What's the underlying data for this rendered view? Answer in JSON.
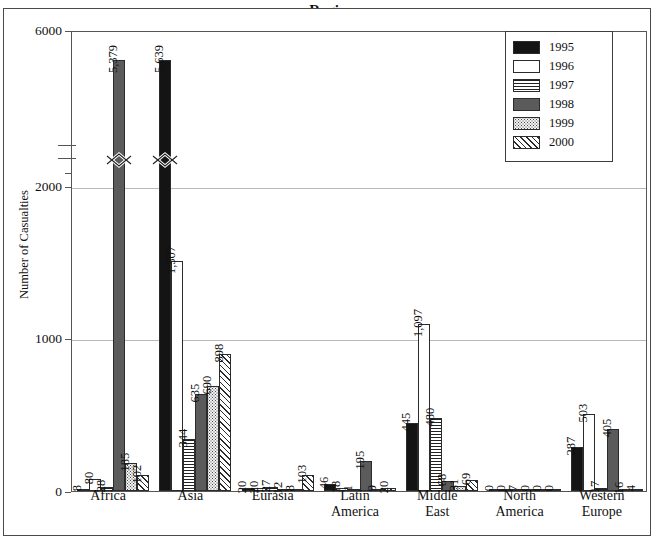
{
  "figure": {
    "title_partial": "y Region,",
    "y_axis_label": "Number of Casualties"
  },
  "legend": {
    "items": [
      {
        "label": "1995",
        "pattern": "solid-black",
        "color": "#141414"
      },
      {
        "label": "1996",
        "pattern": "solid-white",
        "color": "#ffffff"
      },
      {
        "label": "1997",
        "pattern": "horizontal-lines",
        "color": "#ffffff"
      },
      {
        "label": "1998",
        "pattern": "solid-gray",
        "color": "#5b5b5b"
      },
      {
        "label": "1999",
        "pattern": "stipple-dots",
        "color": "#f2f2f2"
      },
      {
        "label": "2000",
        "pattern": "diagonal-hatch",
        "color": "#ffffff"
      }
    ]
  },
  "chart_data": {
    "type": "bar",
    "title": "y Region,",
    "xlabel": "",
    "ylabel": "Number of Casualties",
    "ylim": [
      0,
      6000
    ],
    "yticks": [
      0,
      1000,
      2000,
      6000
    ],
    "ytick_labels": [
      "0",
      "1000",
      "2000",
      "6000"
    ],
    "axis_break": {
      "present": true,
      "between": [
        2000,
        6000
      ],
      "note": "y axis broken above 2000"
    },
    "grid": "horizontal",
    "legend_position": "top-right",
    "categories": [
      "Africa",
      "Asia",
      "Eurasia",
      "Latin\nAmerica",
      "Middle\nEast",
      "North\nAmerica",
      "Western\nEurope"
    ],
    "series": [
      {
        "name": "1995",
        "values": [
          8,
          5639,
          20,
          46,
          445,
          0,
          287
        ],
        "labels": [
          "8",
          "5,639",
          "20",
          "46",
          "445",
          "0",
          "287"
        ]
      },
      {
        "name": "1996",
        "values": [
          80,
          1507,
          20,
          18,
          1097,
          0,
          503
        ],
        "labels": [
          "80",
          "1,507",
          "20",
          "18",
          "1,097",
          "0",
          "503"
        ]
      },
      {
        "name": "1997",
        "values": [
          28,
          344,
          27,
          1,
          480,
          7,
          17
        ],
        "labels": [
          "28",
          "344",
          "27",
          "1",
          "480",
          "7",
          "17"
        ]
      },
      {
        "name": "1998",
        "values": [
          5379,
          635,
          12,
          195,
          68,
          0,
          405
        ],
        "labels": [
          "5,379",
          "635",
          "12",
          "195",
          "68",
          "0",
          "405"
        ]
      },
      {
        "name": "1999",
        "values": [
          185,
          690,
          8,
          9,
          31,
          0,
          16
        ],
        "labels": [
          "185",
          "690",
          "8",
          "9",
          "31",
          "0",
          "16"
        ]
      },
      {
        "name": "2000",
        "values": [
          102,
          898,
          103,
          20,
          69,
          0,
          4
        ],
        "labels": [
          "102",
          "898",
          "103",
          "20",
          "69",
          "0",
          "4"
        ]
      }
    ],
    "broken_bars": [
      {
        "category": "Africa",
        "series": "1998",
        "value": 5379
      },
      {
        "category": "Asia",
        "series": "1995",
        "value": 5639
      }
    ]
  }
}
